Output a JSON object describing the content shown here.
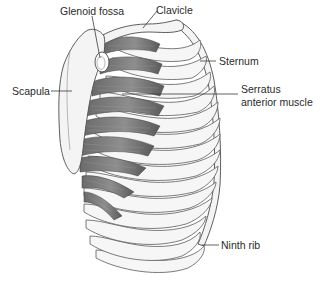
{
  "figure": {
    "colors": {
      "background": "#ffffff",
      "bone": "#f4f4f4",
      "outline": "#4d4d4d",
      "muscle_dark": "#5e5e5e",
      "muscle_light": "#a8a8a8",
      "label_text": "#2a2a2a"
    }
  },
  "labels": {
    "glenoid_fossa": "Glenoid fossa",
    "clavicle": "Clavicle",
    "sternum": "Sternum",
    "scapula": "Scapula",
    "serratus_line1": "Serratus",
    "serratus_line2": "anterior muscle",
    "ninth_rib": "Ninth rib"
  }
}
